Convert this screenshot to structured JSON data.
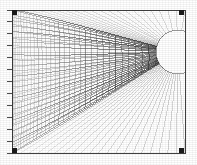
{
  "figure": {
    "title": "",
    "background_color": "#ffffff",
    "ink_color": "#2b2b2b",
    "axis_color": "#3a3a3a",
    "void_color": "#ffffff",
    "width": 197,
    "height": 165
  },
  "chart_data": {
    "type": "line",
    "title": "",
    "subtitle": "",
    "xlabel": "",
    "ylabel": "",
    "legend": [],
    "grid": true,
    "projection": "perspective",
    "mesh": {
      "u_lines": 26,
      "v_lines": 34,
      "shading": "wireframe"
    },
    "plot_area": {
      "x": 12,
      "y": 10,
      "width": 173,
      "height": 143
    },
    "vanishing_point": {
      "x": 178,
      "y": 52
    },
    "void": {
      "cx": 178,
      "cy": 52,
      "rx": 22,
      "ry": 22,
      "label": "throat"
    },
    "axis": {
      "orientation": "vertical-left",
      "x": 12,
      "y_top": 10,
      "y_bottom": 153,
      "tick_count": 13,
      "tick_length": 5,
      "tick_labels": []
    },
    "corner_markers": [
      {
        "x": 14,
        "y": 12
      },
      {
        "x": 181,
        "y": 12
      },
      {
        "x": 181,
        "y": 150
      },
      {
        "x": 14,
        "y": 150
      }
    ],
    "xlim": [
      0,
      197
    ],
    "ylim": [
      0,
      165
    ]
  }
}
